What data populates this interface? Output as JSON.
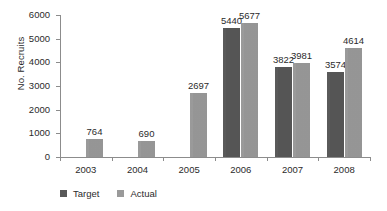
{
  "chart_data": {
    "type": "bar",
    "title": "",
    "subtitle": "",
    "xlabel": "",
    "ylabel": "No. Recruits",
    "categories": [
      "2003",
      "2004",
      "2005",
      "2006",
      "2007",
      "2008"
    ],
    "series": [
      {
        "name": "Target",
        "color": "#585858",
        "values": [
          null,
          null,
          null,
          5440,
          3822,
          3574
        ],
        "labels": [
          "",
          "",
          "",
          "5440",
          "3822",
          "3574"
        ]
      },
      {
        "name": "Actual",
        "color": "#9a9a9a",
        "values": [
          764,
          690,
          2697,
          5677,
          3981,
          4614
        ],
        "labels": [
          "764",
          "690",
          "2697",
          "5677",
          "3981",
          "4614"
        ]
      }
    ],
    "ylim": [
      0,
      6000
    ],
    "ytick_values": [
      0,
      1000,
      2000,
      3000,
      4000,
      5000,
      6000
    ],
    "ytick_labels": [
      "0",
      "1000",
      "2000",
      "3000",
      "4000",
      "5000",
      "6000"
    ],
    "grid": false,
    "legend_position": "bottom-left",
    "legend_entries": [
      "Target",
      "Actual"
    ],
    "axis_color": "#8c8c8c",
    "text_color": "#2b2b2b",
    "background": "#ffffff"
  }
}
